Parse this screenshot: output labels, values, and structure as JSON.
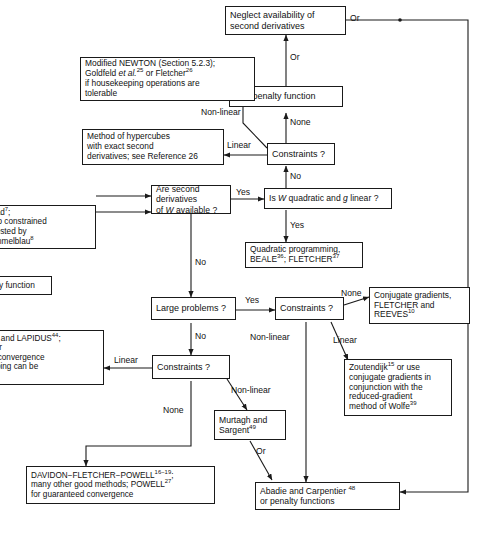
{
  "figure": {
    "type": "flowchart",
    "line_color": "#1a1a1a",
    "background": "#ffffff"
  },
  "nodes": {
    "neglect": "Neglect availability of\nsecond derivatives",
    "penalty_top": "Use penalty function",
    "modified_newton": "Modified NEWTON (Section 5.2.3);\nGoldfeld et al.25 or Fletcher26\nif housekeeping operations are\ntolerable",
    "hypercubes": "Method of hypercubes\nwith exact second\nderivatives; see Reference 26",
    "constraints_top": "Constraints ?",
    "second_derivs": "Are second derivatives\nof W available ?",
    "w_quadratic": "Is W quadratic and g linear ?",
    "quadratic_prog": "Quadratic programming,\nBEALE36; FLETCHER37",
    "nelder_mead": "er and Mead7;\nralization to constrained\nems suggested by\nni and Himmelblau8",
    "penalty_left": "a penalty function",
    "goldfarb": "FARB and LAPIDUS44\ntcher26 for\nnteed convergence\nhousekeeping can be\ned",
    "large_problems": "Large problems ?",
    "constraints_mid": "Constraints ?",
    "conjugate_gradients": "Conjugate gradients,\nFLETCHER and\nREEVES10",
    "constraints_low": "Constraints ?",
    "zoutendijk": "Zoutendijk15 or use\nconjugate gradients in\nconjunction with the\nreduced-gradient\nmethod of Wolfe39",
    "murtagh": "Murtagh and\nSargent49",
    "davidon": "DAVIDON−FLETCHER−POWELL16−19;\nmany other good methods; POWELL27\nfor guaranteed convergence",
    "abadie": "Abadie and Carpentier 48\nor penalty functions"
  },
  "edge_labels": {
    "or_top_right": "Or",
    "or_neglect_penalty": "Or",
    "or_penalty_constraints": "Or",
    "none_top": "None",
    "nonlinear_top": "Non-linear",
    "linear_top": "Linear",
    "no_constraints_top": "No",
    "yes_second_derivs": "Yes",
    "no_second_derivs": "No",
    "yes_w_quadratic": "Yes",
    "yes_large": "Yes",
    "no_large": "No",
    "none_mid": "None",
    "linear_mid": "Linear",
    "nonlinear_mid": "Non-linear",
    "linear_low": "Linear",
    "nonlinear_low": "Non-linear",
    "none_low": "None",
    "or_murtagh": "Or"
  }
}
